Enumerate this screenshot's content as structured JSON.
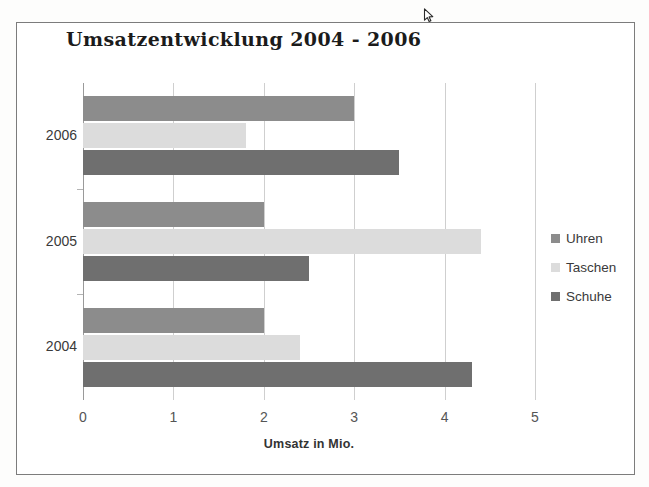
{
  "figure": {
    "title": "Umsatzentwicklung 2004 - 2006"
  },
  "legend": {
    "position": "right",
    "items": [
      {
        "label": "Uhren",
        "color": "#8c8c8c",
        "swatch": "legend-swatch-uhren"
      },
      {
        "label": "Taschen",
        "color": "#dcdcdc",
        "swatch": "legend-swatch-taschen"
      },
      {
        "label": "Schuhe",
        "color": "#6f6f6f",
        "swatch": "legend-swatch-schuhe"
      }
    ]
  },
  "axes": {
    "x_title": "Umsatz in Mio.",
    "x_ticks": [
      "0",
      "1",
      "2",
      "3",
      "4",
      "5"
    ],
    "y_ticks": [
      "2006",
      "2005",
      "2004"
    ]
  },
  "chart_data": {
    "type": "bar",
    "orientation": "horizontal",
    "title": "Umsatzentwicklung 2004 - 2006",
    "xlabel": "Umsatz in Mio.",
    "ylabel": "",
    "xlim": [
      0,
      5
    ],
    "xticks": [
      0,
      1,
      2,
      3,
      4,
      5
    ],
    "grid": true,
    "grid_axis": "x",
    "legend_position": "right",
    "categories": [
      "2006",
      "2005",
      "2004"
    ],
    "series": [
      {
        "name": "Uhren",
        "color": "#8c8c8c",
        "values": [
          3.0,
          2.0,
          2.0
        ]
      },
      {
        "name": "Taschen",
        "color": "#dcdcdc",
        "values": [
          1.8,
          4.4,
          2.4
        ]
      },
      {
        "name": "Schuhe",
        "color": "#6f6f6f",
        "values": [
          3.5,
          2.5,
          4.3
        ]
      }
    ],
    "note": "Bars within each year are drawn top-to-bottom as Uhren, Taschen, Schuhe."
  }
}
